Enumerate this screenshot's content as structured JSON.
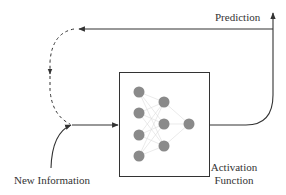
{
  "diagram": {
    "type": "neural-network-feedback-loop",
    "labels": {
      "prediction": "Prediction",
      "new_information": "New Information",
      "activation_line1": "Activation",
      "activation_line2": "Function"
    },
    "network": {
      "layers": [
        4,
        3,
        1
      ]
    },
    "colors": {
      "node": "#8a8a8a",
      "line": "#333333",
      "box_border": "#333333",
      "connection": "#d8d8d8"
    }
  }
}
